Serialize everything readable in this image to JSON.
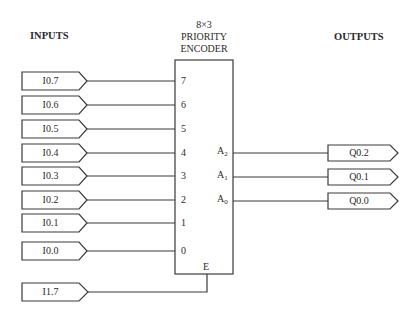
{
  "headers": {
    "inputs": "INPUTS",
    "outputs": "OUTPUTS"
  },
  "encoder": {
    "title_line1": "8×3",
    "title_line2": "PRIORITY",
    "title_line3": "ENCODER",
    "input_pins": [
      "7",
      "6",
      "5",
      "4",
      "3",
      "2",
      "1",
      "0"
    ],
    "output_pins": [
      {
        "base": "A",
        "sub": "2"
      },
      {
        "base": "A",
        "sub": "1"
      },
      {
        "base": "A",
        "sub": "0"
      }
    ],
    "enable_pin": "E"
  },
  "inputs": [
    "I0.7",
    "I0.6",
    "I0.5",
    "I0.4",
    "I0.3",
    "I0.2",
    "I0.1",
    "I0.0"
  ],
  "enable_input": "I1.7",
  "outputs": [
    "Q0.2",
    "Q0.1",
    "Q0.0"
  ],
  "colors": {
    "line": "#3a3a3a",
    "background": "#ffffff"
  }
}
